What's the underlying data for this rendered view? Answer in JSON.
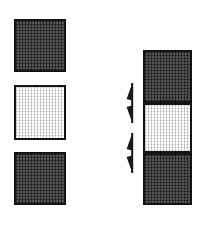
{
  "diagram": {
    "background_color": "#ffffff"
  },
  "colors": {
    "dark_fill": "#464646",
    "light_fill": "#ececec",
    "border": "#141414",
    "arrow": "#1a1a1a"
  },
  "left_column": {
    "name": "separated-squares",
    "items": [
      {
        "id": "sq-top",
        "label": "Top dark square",
        "shade": "dark",
        "fill": "#464646",
        "texture": "cross-hatch"
      },
      {
        "id": "sq-middle",
        "label": "Middle light square",
        "shade": "light",
        "fill": "#ececec",
        "texture": "cross-hatch"
      },
      {
        "id": "sq-bottom",
        "label": "Bottom dark square",
        "shade": "dark",
        "fill": "#464646",
        "texture": "cross-hatch"
      }
    ]
  },
  "right_column": {
    "name": "assembled-stack",
    "items": [
      {
        "id": "stk-top",
        "label": "Stack top dark block",
        "shade": "dark",
        "fill": "#464646",
        "texture": "cross-hatch"
      },
      {
        "id": "stk-middle",
        "label": "Stack middle light block",
        "shade": "light",
        "fill": "#ececec",
        "texture": "cross-hatch"
      },
      {
        "id": "stk-bottom",
        "label": "Stack bottom dark block",
        "shade": "dark",
        "fill": "#464646",
        "texture": "cross-hatch"
      }
    ]
  },
  "markers": [
    {
      "id": "marker-top",
      "label": "Upper insertion arrow marker",
      "shape": "vertical-line-with-two-arrowheads",
      "points_to": "stk-middle top seam"
    },
    {
      "id": "marker-bottom",
      "label": "Lower insertion arrow marker",
      "shape": "vertical-line-with-two-arrowheads",
      "points_to": "stk-middle bottom seam"
    }
  ]
}
